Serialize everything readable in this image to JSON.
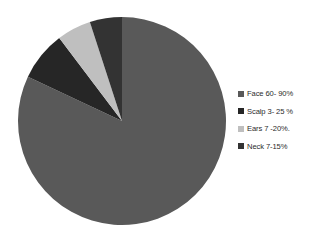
{
  "chart_data": {
    "type": "pie",
    "title": "",
    "xlabel": "",
    "ylabel": "",
    "legend_position": "right",
    "grid": false,
    "start_angle_deg": 0,
    "direction": "clockwise",
    "categories": [
      "Face 60- 90%",
      "Scalp 3- 25 %",
      "Ears 7 -20%.",
      "Neck 7-15%"
    ],
    "values": [
      82.0,
      7.7,
      5.3,
      5.0
    ],
    "slice_angles_deg": [
      295.2,
      27.7,
      19.1,
      18.0
    ],
    "colors": [
      "#595959",
      "#262626",
      "#bfbfbf",
      "#333333"
    ],
    "series": [
      {
        "name": "Distribution of lesions",
        "values": [
          82.0,
          7.7,
          5.3,
          5.0
        ]
      }
    ],
    "annotations": []
  },
  "legend": {
    "items": [
      {
        "label": "Face 60- 90%",
        "color": "#595959",
        "swatch_name": "legend-swatch-face"
      },
      {
        "label": "Scalp 3- 25 %",
        "color": "#262626",
        "swatch_name": "legend-swatch-scalp"
      },
      {
        "label": "Ears 7 -20%.",
        "color": "#bfbfbf",
        "swatch_name": "legend-swatch-ears"
      },
      {
        "label": "Neck 7-15%",
        "color": "#333333",
        "swatch_name": "legend-swatch-neck"
      }
    ]
  },
  "pie": {
    "center_x": 104,
    "center_y": 108,
    "radius": 104,
    "slices": [
      {
        "name": "face-slice",
        "label": "Face 60- 90%",
        "color": "#595959",
        "start_deg": 0,
        "end_deg": 295.2
      },
      {
        "name": "scalp-slice",
        "label": "Scalp 3- 25 %",
        "color": "#262626",
        "start_deg": 295.2,
        "end_deg": 322.9
      },
      {
        "name": "ears-slice",
        "label": "Ears 7 -20%.",
        "color": "#bfbfbf",
        "start_deg": 322.9,
        "end_deg": 342.0
      },
      {
        "name": "neck-slice",
        "label": "Neck 7-15%",
        "color": "#333333",
        "start_deg": 342.0,
        "end_deg": 360
      }
    ]
  }
}
